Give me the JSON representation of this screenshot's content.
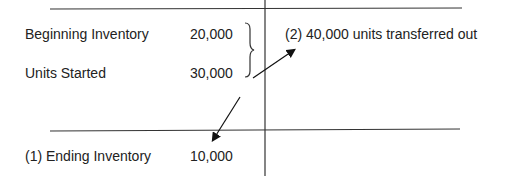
{
  "taccount": {
    "debit": {
      "rows": [
        {
          "label": "Beginning Inventory",
          "value": "20,000"
        },
        {
          "label": "Units Started",
          "value": "30,000"
        }
      ],
      "ending": {
        "label": "(1) Ending Inventory",
        "value": "10,000"
      }
    },
    "credit": {
      "transferred": "(2) 40,000 units transferred out"
    }
  },
  "colors": {
    "line": "#333333",
    "text": "#222222"
  }
}
